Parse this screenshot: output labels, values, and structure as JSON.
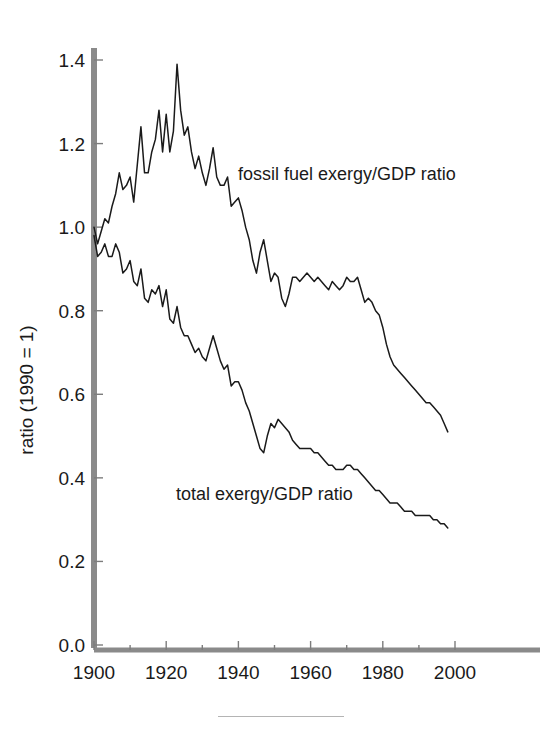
{
  "figure": {
    "background_color": "#ffffff",
    "line_color": "#1a1a1a",
    "axis_color": "#8a8a8a"
  },
  "axes": {
    "y_axis_title": "ratio (1990 = 1)",
    "x_axis_title": "",
    "y_ticks": [
      "1.4",
      "1.2",
      "1.0",
      "0.8",
      "0.6",
      "0.4",
      "0.2",
      "0.0"
    ],
    "x_ticks": [
      "1900",
      "1920",
      "1940",
      "1960",
      "1980",
      "2000"
    ]
  },
  "labels": {
    "fossil": "fossil fuel exergy/GDP ratio",
    "total": "total exergy/GDP ratio"
  },
  "chart_data": {
    "type": "line",
    "title": "",
    "xlabel": "",
    "ylabel": "ratio (1990 = 1)",
    "xlim": [
      1900,
      2003
    ],
    "ylim": [
      0.0,
      1.45
    ],
    "grid": false,
    "legend_position": "inline-annotation",
    "yticks": [
      0.0,
      0.2,
      0.4,
      0.6,
      0.8,
      1.0,
      1.2,
      1.4
    ],
    "xticks": [
      1900,
      1920,
      1940,
      1960,
      1980,
      2000
    ],
    "xticks_minor": [
      1910,
      1930,
      1950,
      1970,
      1990
    ],
    "x": [
      1900,
      1901,
      1902,
      1903,
      1904,
      1905,
      1906,
      1907,
      1908,
      1909,
      1910,
      1911,
      1912,
      1913,
      1914,
      1915,
      1916,
      1917,
      1918,
      1919,
      1920,
      1921,
      1922,
      1923,
      1924,
      1925,
      1926,
      1927,
      1928,
      1929,
      1930,
      1931,
      1932,
      1933,
      1934,
      1935,
      1936,
      1937,
      1938,
      1939,
      1940,
      1941,
      1942,
      1943,
      1944,
      1945,
      1946,
      1947,
      1948,
      1949,
      1950,
      1951,
      1952,
      1953,
      1954,
      1955,
      1956,
      1957,
      1958,
      1959,
      1960,
      1961,
      1962,
      1963,
      1964,
      1965,
      1966,
      1967,
      1968,
      1969,
      1970,
      1971,
      1972,
      1973,
      1974,
      1975,
      1976,
      1977,
      1978,
      1979,
      1980,
      1981,
      1982,
      1983,
      1984,
      1985,
      1986,
      1987,
      1988,
      1989,
      1990,
      1991,
      1992,
      1993,
      1994,
      1995,
      1996,
      1997,
      1998
    ],
    "series": [
      {
        "name": "fossil fuel exergy/GDP ratio",
        "label_text": "fossil fuel exergy/GDP ratio",
        "values": [
          1.0,
          0.96,
          0.99,
          1.02,
          1.01,
          1.05,
          1.08,
          1.13,
          1.09,
          1.1,
          1.12,
          1.06,
          1.15,
          1.24,
          1.13,
          1.13,
          1.18,
          1.21,
          1.28,
          1.18,
          1.27,
          1.18,
          1.23,
          1.39,
          1.28,
          1.22,
          1.24,
          1.18,
          1.14,
          1.17,
          1.13,
          1.1,
          1.14,
          1.19,
          1.12,
          1.1,
          1.1,
          1.12,
          1.05,
          1.06,
          1.07,
          1.04,
          1.0,
          0.97,
          0.92,
          0.89,
          0.94,
          0.97,
          0.92,
          0.87,
          0.89,
          0.88,
          0.83,
          0.81,
          0.84,
          0.88,
          0.88,
          0.87,
          0.88,
          0.89,
          0.88,
          0.87,
          0.88,
          0.87,
          0.86,
          0.85,
          0.87,
          0.86,
          0.85,
          0.86,
          0.88,
          0.87,
          0.87,
          0.88,
          0.85,
          0.82,
          0.83,
          0.82,
          0.8,
          0.79,
          0.76,
          0.72,
          0.69,
          0.67,
          0.66,
          0.65,
          0.64,
          0.63,
          0.62,
          0.61,
          0.6,
          0.59,
          0.58,
          0.58,
          0.57,
          0.56,
          0.55,
          0.53,
          0.51
        ]
      },
      {
        "name": "total exergy/GDP ratio",
        "label_text": "total exergy/GDP ratio",
        "values": [
          0.98,
          0.93,
          0.94,
          0.96,
          0.93,
          0.93,
          0.96,
          0.94,
          0.89,
          0.9,
          0.92,
          0.87,
          0.86,
          0.9,
          0.83,
          0.82,
          0.85,
          0.84,
          0.86,
          0.81,
          0.85,
          0.78,
          0.77,
          0.81,
          0.76,
          0.74,
          0.74,
          0.72,
          0.7,
          0.71,
          0.69,
          0.68,
          0.71,
          0.74,
          0.71,
          0.68,
          0.66,
          0.67,
          0.62,
          0.63,
          0.63,
          0.61,
          0.58,
          0.56,
          0.53,
          0.5,
          0.47,
          0.46,
          0.5,
          0.53,
          0.52,
          0.54,
          0.53,
          0.52,
          0.51,
          0.49,
          0.48,
          0.47,
          0.47,
          0.47,
          0.47,
          0.46,
          0.46,
          0.45,
          0.44,
          0.43,
          0.43,
          0.42,
          0.42,
          0.42,
          0.43,
          0.43,
          0.42,
          0.42,
          0.41,
          0.4,
          0.39,
          0.38,
          0.37,
          0.37,
          0.36,
          0.35,
          0.34,
          0.34,
          0.34,
          0.33,
          0.32,
          0.32,
          0.32,
          0.31,
          0.31,
          0.31,
          0.31,
          0.31,
          0.3,
          0.3,
          0.29,
          0.29,
          0.28
        ]
      }
    ]
  }
}
